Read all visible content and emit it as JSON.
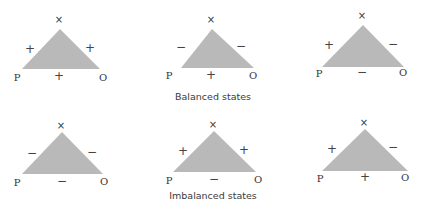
{
  "colors": {
    "triangle_fill": "#b9b9b9",
    "text": "#3a3a3a",
    "background": "#ffffff"
  },
  "node_labels": {
    "apex": "×",
    "left": "P",
    "right": "O"
  },
  "groups": [
    {
      "caption": "Balanced states",
      "triangles": [
        {
          "left_edge": "+",
          "right_edge": "+",
          "base_edge": "+"
        },
        {
          "left_edge": "−",
          "right_edge": "−",
          "base_edge": "+"
        },
        {
          "left_edge": "+",
          "right_edge": "−",
          "base_edge": "−"
        }
      ]
    },
    {
      "caption": "Imbalanced states",
      "triangles": [
        {
          "left_edge": "−",
          "right_edge": "−",
          "base_edge": "−"
        },
        {
          "left_edge": "+",
          "right_edge": "+",
          "base_edge": "−"
        },
        {
          "left_edge": "+",
          "right_edge": "−",
          "base_edge": "+"
        }
      ]
    }
  ]
}
